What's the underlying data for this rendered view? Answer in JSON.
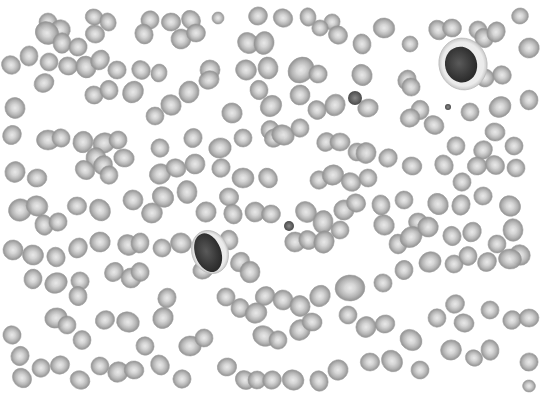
{
  "image": {
    "description": "Grayscale peripheral blood smear micrograph showing numerous red blood cells and two lymphocytes",
    "width": 543,
    "height": 399,
    "content_bounds": {
      "x": 0,
      "y": 14,
      "w": 537,
      "h": 376
    },
    "colors": {
      "background": "#ffffff",
      "rbc_rim": "#8f8f8f",
      "rbc_mid": "#b4b4b4",
      "rbc_center": "#e6e6e6",
      "nucleus_dark": "#2e2e2e",
      "nucleus_mid": "#555555",
      "cytoplasm": "#ececec",
      "platelet": "#7a7a7a"
    }
  },
  "lymphocytes": [
    {
      "cx": 463,
      "cy": 64,
      "nucleus_rx": 16,
      "nucleus_ry": 18,
      "cell_rx": 24,
      "cell_ry": 26,
      "rot": -15
    },
    {
      "cx": 210,
      "cy": 252,
      "nucleus_rx": 13,
      "nucleus_ry": 20,
      "cell_rx": 18,
      "cell_ry": 22,
      "rot": -20
    }
  ],
  "small_dark_cells": [
    {
      "cx": 355,
      "cy": 98,
      "r": 7
    },
    {
      "cx": 289,
      "cy": 226,
      "r": 5
    },
    {
      "cx": 448,
      "cy": 107,
      "r": 3
    }
  ],
  "rbcs": [
    [
      48,
      22,
      9
    ],
    [
      60,
      30,
      10
    ],
    [
      94,
      17,
      8
    ],
    [
      108,
      22,
      8
    ],
    [
      150,
      20,
      9
    ],
    [
      171,
      22,
      9
    ],
    [
      191,
      20,
      9
    ],
    [
      218,
      18,
      6
    ],
    [
      258,
      16,
      9
    ],
    [
      283,
      18,
      9
    ],
    [
      308,
      17,
      8
    ],
    [
      332,
      22,
      8
    ],
    [
      384,
      28,
      10
    ],
    [
      438,
      30,
      9
    ],
    [
      478,
      30,
      9
    ],
    [
      520,
      16,
      8
    ],
    [
      47,
      33,
      11
    ],
    [
      62,
      43,
      9
    ],
    [
      78,
      47,
      9
    ],
    [
      95,
      34,
      9
    ],
    [
      144,
      34,
      9
    ],
    [
      181,
      39,
      10
    ],
    [
      196,
      33,
      9
    ],
    [
      248,
      43,
      10
    ],
    [
      264,
      43,
      10
    ],
    [
      320,
      28,
      8
    ],
    [
      338,
      35,
      9
    ],
    [
      362,
      44,
      9
    ],
    [
      410,
      44,
      8
    ],
    [
      452,
      28,
      9
    ],
    [
      484,
      38,
      9
    ],
    [
      496,
      32,
      9
    ],
    [
      529,
      48,
      10
    ],
    [
      11,
      65,
      9
    ],
    [
      29,
      56,
      9
    ],
    [
      49,
      62,
      9
    ],
    [
      68,
      66,
      9
    ],
    [
      86,
      67,
      10
    ],
    [
      100,
      60,
      9
    ],
    [
      117,
      70,
      9
    ],
    [
      141,
      70,
      9
    ],
    [
      159,
      73,
      8
    ],
    [
      210,
      70,
      10
    ],
    [
      246,
      70,
      10
    ],
    [
      268,
      68,
      10
    ],
    [
      301,
      70,
      12
    ],
    [
      318,
      74,
      9
    ],
    [
      362,
      75,
      10
    ],
    [
      407,
      80,
      9
    ],
    [
      485,
      78,
      9
    ],
    [
      502,
      75,
      9
    ],
    [
      529,
      100,
      9
    ],
    [
      44,
      83,
      9
    ],
    [
      94,
      95,
      9
    ],
    [
      109,
      90,
      9
    ],
    [
      133,
      92,
      10
    ],
    [
      155,
      116,
      9
    ],
    [
      171,
      105,
      10
    ],
    [
      189,
      92,
      10
    ],
    [
      209,
      80,
      9
    ],
    [
      232,
      113,
      10
    ],
    [
      259,
      90,
      9
    ],
    [
      271,
      106,
      10
    ],
    [
      300,
      95,
      10
    ],
    [
      317,
      110,
      9
    ],
    [
      335,
      105,
      10
    ],
    [
      368,
      108,
      9
    ],
    [
      411,
      87,
      9
    ],
    [
      420,
      110,
      9
    ],
    [
      500,
      107,
      10
    ],
    [
      470,
      112,
      9
    ],
    [
      15,
      108,
      10
    ],
    [
      12,
      135,
      9
    ],
    [
      48,
      140,
      10
    ],
    [
      61,
      138,
      9
    ],
    [
      83,
      142,
      10
    ],
    [
      104,
      143,
      10
    ],
    [
      118,
      140,
      9
    ],
    [
      96,
      158,
      10
    ],
    [
      103,
      165,
      9
    ],
    [
      124,
      158,
      9
    ],
    [
      160,
      148,
      9
    ],
    [
      193,
      138,
      9
    ],
    [
      220,
      148,
      10
    ],
    [
      243,
      138,
      9
    ],
    [
      270,
      130,
      9
    ],
    [
      274,
      138,
      9
    ],
    [
      283,
      135,
      10
    ],
    [
      300,
      128,
      9
    ],
    [
      326,
      142,
      9
    ],
    [
      340,
      142,
      9
    ],
    [
      357,
      152,
      9
    ],
    [
      366,
      153,
      10
    ],
    [
      410,
      118,
      9
    ],
    [
      434,
      125,
      9
    ],
    [
      456,
      146,
      9
    ],
    [
      483,
      150,
      9
    ],
    [
      495,
      132,
      9
    ],
    [
      514,
      146,
      9
    ],
    [
      15,
      172,
      10
    ],
    [
      37,
      178,
      9
    ],
    [
      85,
      170,
      9
    ],
    [
      109,
      175,
      9
    ],
    [
      160,
      174,
      10
    ],
    [
      176,
      168,
      9
    ],
    [
      195,
      164,
      10
    ],
    [
      221,
      168,
      9
    ],
    [
      243,
      178,
      10
    ],
    [
      268,
      178,
      9
    ],
    [
      319,
      180,
      9
    ],
    [
      333,
      175,
      10
    ],
    [
      351,
      182,
      9
    ],
    [
      368,
      178,
      9
    ],
    [
      388,
      158,
      9
    ],
    [
      412,
      166,
      9
    ],
    [
      444,
      165,
      9
    ],
    [
      462,
      182,
      9
    ],
    [
      477,
      166,
      9
    ],
    [
      495,
      165,
      9
    ],
    [
      516,
      168,
      9
    ],
    [
      20,
      210,
      11
    ],
    [
      37,
      206,
      10
    ],
    [
      44,
      225,
      9
    ],
    [
      58,
      222,
      9
    ],
    [
      77,
      206,
      9
    ],
    [
      100,
      210,
      10
    ],
    [
      133,
      200,
      10
    ],
    [
      152,
      213,
      10
    ],
    [
      163,
      197,
      10
    ],
    [
      187,
      192,
      10
    ],
    [
      206,
      212,
      10
    ],
    [
      229,
      197,
      9
    ],
    [
      233,
      214,
      9
    ],
    [
      255,
      212,
      10
    ],
    [
      271,
      214,
      9
    ],
    [
      306,
      212,
      10
    ],
    [
      323,
      222,
      10
    ],
    [
      344,
      210,
      10
    ],
    [
      356,
      203,
      9
    ],
    [
      381,
      205,
      9
    ],
    [
      404,
      200,
      9
    ],
    [
      418,
      222,
      9
    ],
    [
      438,
      204,
      10
    ],
    [
      461,
      205,
      9
    ],
    [
      483,
      196,
      9
    ],
    [
      510,
      206,
      10
    ],
    [
      513,
      230,
      10
    ],
    [
      13,
      250,
      10
    ],
    [
      33,
      255,
      10
    ],
    [
      56,
      257,
      9
    ],
    [
      78,
      248,
      9
    ],
    [
      100,
      242,
      10
    ],
    [
      128,
      245,
      10
    ],
    [
      140,
      243,
      9
    ],
    [
      162,
      248,
      9
    ],
    [
      181,
      243,
      10
    ],
    [
      229,
      240,
      9
    ],
    [
      240,
      262,
      9
    ],
    [
      295,
      242,
      10
    ],
    [
      308,
      240,
      9
    ],
    [
      324,
      242,
      10
    ],
    [
      340,
      230,
      9
    ],
    [
      384,
      225,
      10
    ],
    [
      398,
      244,
      9
    ],
    [
      411,
      237,
      10
    ],
    [
      428,
      227,
      10
    ],
    [
      452,
      236,
      9
    ],
    [
      472,
      232,
      9
    ],
    [
      497,
      244,
      9
    ],
    [
      520,
      255,
      10
    ],
    [
      33,
      279,
      9
    ],
    [
      56,
      283,
      10
    ],
    [
      80,
      281,
      9
    ],
    [
      78,
      296,
      9
    ],
    [
      114,
      272,
      9
    ],
    [
      131,
      278,
      10
    ],
    [
      140,
      272,
      9
    ],
    [
      167,
      298,
      9
    ],
    [
      203,
      270,
      9
    ],
    [
      226,
      297,
      9
    ],
    [
      250,
      272,
      10
    ],
    [
      265,
      296,
      9
    ],
    [
      283,
      300,
      10
    ],
    [
      300,
      306,
      10
    ],
    [
      320,
      296,
      10
    ],
    [
      350,
      288,
      13
    ],
    [
      383,
      283,
      9
    ],
    [
      404,
      270,
      9
    ],
    [
      430,
      262,
      10
    ],
    [
      454,
      264,
      9
    ],
    [
      468,
      256,
      9
    ],
    [
      487,
      262,
      9
    ],
    [
      510,
      259,
      10
    ],
    [
      12,
      335,
      9
    ],
    [
      20,
      356,
      9
    ],
    [
      56,
      318,
      10
    ],
    [
      67,
      325,
      9
    ],
    [
      82,
      340,
      9
    ],
    [
      105,
      320,
      9
    ],
    [
      128,
      322,
      10
    ],
    [
      145,
      346,
      9
    ],
    [
      163,
      318,
      10
    ],
    [
      190,
      346,
      10
    ],
    [
      204,
      338,
      9
    ],
    [
      240,
      308,
      9
    ],
    [
      256,
      313,
      10
    ],
    [
      264,
      336,
      10
    ],
    [
      278,
      340,
      9
    ],
    [
      300,
      330,
      10
    ],
    [
      312,
      322,
      9
    ],
    [
      348,
      315,
      9
    ],
    [
      366,
      327,
      10
    ],
    [
      385,
      324,
      9
    ],
    [
      411,
      340,
      10
    ],
    [
      437,
      318,
      9
    ],
    [
      455,
      304,
      9
    ],
    [
      464,
      323,
      9
    ],
    [
      490,
      310,
      9
    ],
    [
      512,
      320,
      9
    ],
    [
      529,
      318,
      9
    ],
    [
      22,
      378,
      9
    ],
    [
      41,
      368,
      9
    ],
    [
      60,
      365,
      9
    ],
    [
      80,
      380,
      9
    ],
    [
      100,
      366,
      9
    ],
    [
      118,
      372,
      10
    ],
    [
      134,
      370,
      9
    ],
    [
      160,
      365,
      9
    ],
    [
      182,
      379,
      9
    ],
    [
      227,
      367,
      9
    ],
    [
      245,
      380,
      9
    ],
    [
      257,
      380,
      9
    ],
    [
      272,
      380,
      9
    ],
    [
      293,
      380,
      10
    ],
    [
      319,
      381,
      9
    ],
    [
      338,
      370,
      10
    ],
    [
      370,
      362,
      9
    ],
    [
      392,
      361,
      10
    ],
    [
      420,
      370,
      9
    ],
    [
      451,
      350,
      10
    ],
    [
      474,
      358,
      8
    ],
    [
      490,
      350,
      9
    ],
    [
      529,
      362,
      9
    ],
    [
      529,
      386,
      6
    ]
  ]
}
